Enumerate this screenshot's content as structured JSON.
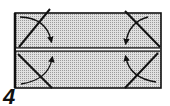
{
  "diagram": {
    "type": "origami-step",
    "step_number": "4",
    "paper_color": "#c8c8c8",
    "line_color": "#111111",
    "instructions": {
      "folds": [
        {
          "corner": "top-left",
          "direction": "fold corner down-right to center crease"
        },
        {
          "corner": "top-right",
          "direction": "fold corner down-left to center crease"
        },
        {
          "corner": "bottom-left",
          "direction": "fold corner up-right to center crease"
        },
        {
          "corner": "bottom-right",
          "direction": "fold corner up-left to center crease"
        }
      ],
      "center_crease": "horizontal double line"
    }
  }
}
